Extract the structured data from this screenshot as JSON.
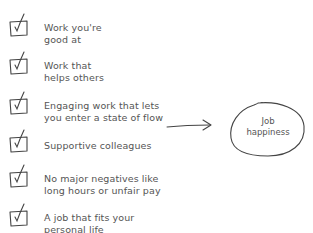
{
  "diagram": {
    "items": [
      {
        "line1": "Work you're",
        "line2": "good at",
        "icon": "checkbox-checked-icon"
      },
      {
        "line1": "Work that",
        "line2": "helps others",
        "icon": "checkbox-checked-icon"
      },
      {
        "line1": "Engaging work that lets",
        "line2": "you enter a state of flow",
        "icon": "checkbox-checked-icon"
      },
      {
        "line1": "Supportive colleagues",
        "line2": "",
        "icon": "checkbox-checked-icon"
      },
      {
        "line1": "No major negatives like",
        "line2": "long hours or unfair pay",
        "icon": "checkbox-checked-icon"
      },
      {
        "line1": "A job that fits your",
        "line2": "personal life",
        "icon": "checkbox-checked-icon"
      }
    ],
    "arrow_icon": "arrow-right-icon",
    "outcome": {
      "line1": "Job",
      "line2": "happiness"
    },
    "stroke_color": "#444444",
    "text_color": "#555555"
  }
}
